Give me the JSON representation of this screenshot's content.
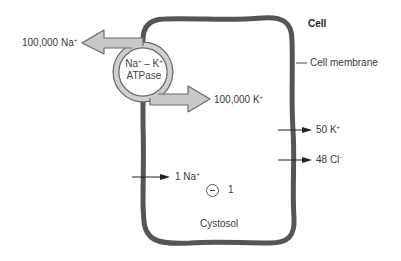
{
  "diagram": {
    "title": "Cell",
    "membrane_label": "Cell membrane",
    "pump": {
      "line1_a": "Na",
      "line1_a_sup": "+",
      "line1_sep": " – K",
      "line1_b_sup": "+",
      "line2": "ATPase"
    },
    "pump_out": {
      "count": "100,000 Na",
      "sup": "+"
    },
    "pump_in": {
      "count": "100,000 K",
      "sup": "+"
    },
    "leak_in_na": {
      "count": "1 Na",
      "sup": "+"
    },
    "leak_out_k": {
      "count": "50 K",
      "sup": "+"
    },
    "leak_out_cl": {
      "count": "48 Cl",
      "sup": "−"
    },
    "net_charge": {
      "value": "1",
      "symbol": "negative-charge"
    },
    "compartment_label": "Cystosol"
  },
  "colors": {
    "membrane": "#555555",
    "pump_fill": "#c8c8c8",
    "pump_stroke": "#6a6a6a",
    "arrow_line": "#222222",
    "text": "#3a3a3a"
  }
}
